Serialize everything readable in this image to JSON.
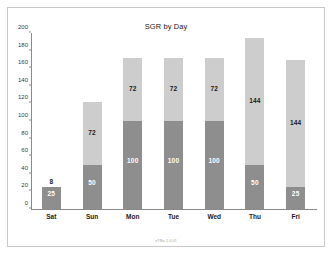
{
  "chart_data": {
    "type": "bar",
    "stacked": true,
    "title": "SGR by Day",
    "xlabel": "",
    "ylabel": "",
    "ylim": [
      0,
      200
    ],
    "yticks": [
      0,
      20,
      40,
      60,
      80,
      100,
      120,
      140,
      160,
      180,
      200
    ],
    "grid": false,
    "legend": "none",
    "categories": [
      "Sat",
      "Sun",
      "Mon",
      "Tue",
      "Wed",
      "Thu",
      "Fri"
    ],
    "series": [
      {
        "name": "base",
        "color": "#8e8e8e",
        "values": [
          8,
          8,
          8,
          8,
          8,
          8,
          8
        ],
        "labels": [
          "",
          "",
          "",
          "",
          "",
          "",
          ""
        ]
      },
      {
        "name": "middle",
        "color": "#8e8e8e",
        "values": [
          17,
          42,
          92,
          92,
          92,
          42,
          17
        ],
        "labels": [
          "25",
          "50",
          "100",
          "100",
          "100",
          "50",
          "25"
        ]
      },
      {
        "name": "top",
        "color": "#cdcdcd",
        "values": [
          0,
          72,
          72,
          72,
          72,
          144,
          144
        ],
        "labels": [
          "",
          "72",
          "72",
          "72",
          "72",
          "144",
          "144"
        ]
      }
    ],
    "totals": [
      25,
      122,
      172,
      172,
      172,
      194,
      169
    ],
    "outer_labels": [
      "8",
      "",
      "",
      "",
      "",
      "",
      ""
    ],
    "footer_note": "nTNe-1.0.01"
  },
  "colors": {
    "frame_border": "#c8c8c8",
    "axis": "#8a8a8a",
    "bar_dark": "#8e8e8e",
    "bar_light": "#cdcdcd",
    "text": "#1a1a1a",
    "tick_text": "#3a3a3a",
    "background": "#ffffff"
  }
}
